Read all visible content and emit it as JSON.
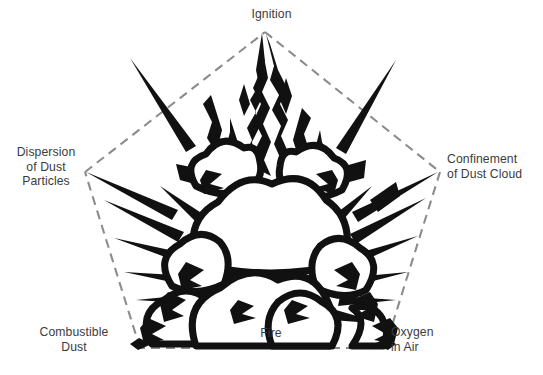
{
  "diagram": {
    "type": "dust-explosion-pentagon",
    "shape": "pentagon",
    "edge_style": "dashed",
    "colors": {
      "background": "#ffffff",
      "edge": "#8c8c8e",
      "text": "#3b3b3d",
      "illustration_outline": "#111111",
      "illustration_fill": "#ffffff"
    },
    "vertices": [
      {
        "id": "ignition",
        "label": "Ignition",
        "position": "top",
        "x": 265,
        "y": 32
      },
      {
        "id": "confinement",
        "label": "Confinement\nof Dust Cloud",
        "position": "right",
        "x": 440,
        "y": 172
      },
      {
        "id": "oxygen",
        "label": "Oxygen\nin Air",
        "position": "bottom-right",
        "x": 385,
        "y": 348
      },
      {
        "id": "combustible",
        "label": "Combustible\nDust",
        "position": "bottom-left",
        "x": 140,
        "y": 348
      },
      {
        "id": "dispersion",
        "label": "Dispersion\nof Dust\nParticles",
        "position": "left",
        "x": 85,
        "y": 172
      }
    ],
    "center": {
      "id": "fire",
      "label": "Fire",
      "x": 265,
      "y": 334
    },
    "illustration": {
      "name": "dust-explosion-illustration",
      "description": "black-and-white line-art explosion with billowing cloud lobes, radiating spikes and rising flames"
    }
  }
}
